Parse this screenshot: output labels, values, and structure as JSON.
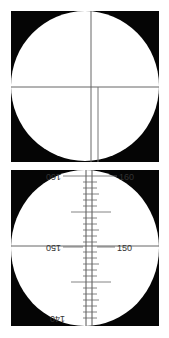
{
  "figure": {
    "background": "#ffffff",
    "panel_color": "#050505",
    "field_color": "#ffffff",
    "line_color": "#555555"
  },
  "panel_top": {
    "description": "Crosshair reticle field of view",
    "lines": [
      "vertical-center",
      "horizontal-center",
      "offset-vertical-lower"
    ]
  },
  "panel_bottom": {
    "description": "Graduated scale reticle field of view",
    "labels": {
      "top_left": "160",
      "top_right": "160",
      "middle_left": "150",
      "middle_right": "150",
      "bottom_left": "140"
    }
  }
}
